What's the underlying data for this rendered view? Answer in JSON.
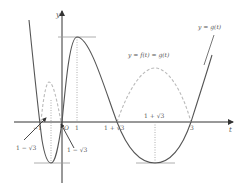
{
  "axes": {
    "x_label": "t",
    "y_label": "y"
  },
  "curves": {
    "g_label": "y = g(t)",
    "h_label": "y = f(t) = g(t)"
  },
  "ticks": {
    "minus_one": "−1",
    "origin": "O",
    "one": "1",
    "one_plus_sqrt3_left": "1 + √3",
    "one_plus_sqrt3_top": "1 + √3",
    "three": "3"
  },
  "annotations": {
    "left_arrow_label": "1 − √3",
    "right_arrow_label": "1 − √3"
  },
  "colors": {
    "solid_curve": "#555555",
    "dashed_curve": "#bbbbbb",
    "axis": "#333333",
    "guide": "#999999"
  }
}
